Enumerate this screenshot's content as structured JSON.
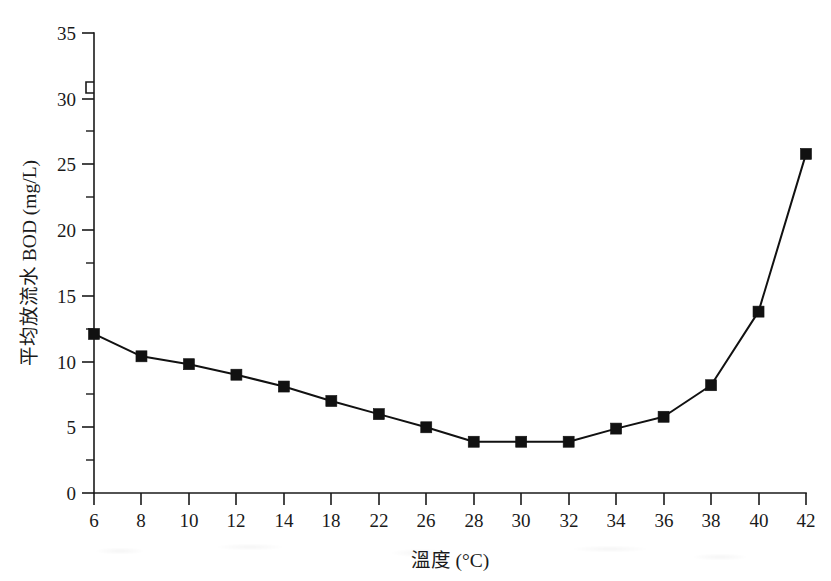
{
  "figure": {
    "background_color": "#ffffff",
    "ink_color": "#111111"
  },
  "chart_data": {
    "type": "line",
    "title": "",
    "subtitle": "",
    "xlabel": "溫度 (°C)",
    "ylabel": "平均放流水 BOD (mg/L)",
    "categories": [
      "6",
      "8",
      "10",
      "12",
      "14",
      "18",
      "22",
      "26",
      "28",
      "30",
      "32",
      "34",
      "36",
      "38",
      "40",
      "42"
    ],
    "x": [
      6,
      8,
      10,
      12,
      14,
      18,
      22,
      26,
      28,
      30,
      32,
      34,
      36,
      38,
      40,
      42
    ],
    "values": [
      12.1,
      10.4,
      9.8,
      9.0,
      8.1,
      7.0,
      6.0,
      5.0,
      3.9,
      3.9,
      3.9,
      4.9,
      5.8,
      8.2,
      13.8,
      25.8
    ],
    "series": [
      {
        "name": "平均放流水 BOD",
        "values": [
          12.1,
          10.4,
          9.8,
          9.0,
          8.1,
          7.0,
          6.0,
          5.0,
          3.9,
          3.9,
          3.9,
          4.9,
          5.8,
          8.2,
          13.8,
          25.8
        ],
        "marker": "square",
        "marker_color": "#111111",
        "line_color": "#111111"
      }
    ],
    "ylim": [
      0,
      35
    ],
    "xlim_note": "categorical evenly-spaced ticks; x spacing is not linear in temperature",
    "ytick_labels": [
      "0",
      "5",
      "10",
      "15",
      "20",
      "25",
      "30",
      "35"
    ],
    "ytick_values": [
      0,
      5,
      10,
      15,
      20,
      25,
      30,
      35
    ],
    "yminor_values": [
      2.5,
      7.5,
      12.5,
      17.5,
      22.5,
      27.5,
      32.5
    ],
    "xtick_labels": [
      "6",
      "8",
      "10",
      "12",
      "14",
      "18",
      "22",
      "26",
      "28",
      "30",
      "32",
      "34",
      "36",
      "38",
      "40",
      "42"
    ],
    "grid": false,
    "legend": false,
    "legend_position": "none",
    "axis_break": {
      "present": true,
      "axis": "y",
      "between": [
        30,
        35
      ],
      "symbol": "zigzag-break"
    },
    "annotations": []
  }
}
